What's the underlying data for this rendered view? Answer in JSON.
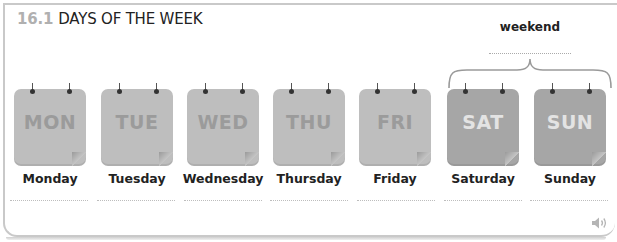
{
  "header": {
    "section_number": "16.1",
    "title": "DAYS OF THE WEEK"
  },
  "weekend_group": {
    "label": "weekend",
    "answer_placeholder": ""
  },
  "days": [
    {
      "abbr": "MON",
      "label": "Monday",
      "type": "weekday"
    },
    {
      "abbr": "TUE",
      "label": "Tuesday",
      "type": "weekday"
    },
    {
      "abbr": "WED",
      "label": "Wednesday",
      "type": "weekday"
    },
    {
      "abbr": "THU",
      "label": "Thursday",
      "type": "weekday"
    },
    {
      "abbr": "FRI",
      "label": "Friday",
      "type": "weekday"
    },
    {
      "abbr": "SAT",
      "label": "Saturday",
      "type": "weekend"
    },
    {
      "abbr": "SUN",
      "label": "Sunday",
      "type": "weekend"
    }
  ],
  "colors": {
    "weekday_card": "#bebebe",
    "weekday_text": "#9b9b9b",
    "weekend_card": "#a6a6a6",
    "weekend_text": "#e3e3e3",
    "section_number": "#b0b0b0"
  },
  "audio": {
    "icon": "speaker-icon"
  }
}
